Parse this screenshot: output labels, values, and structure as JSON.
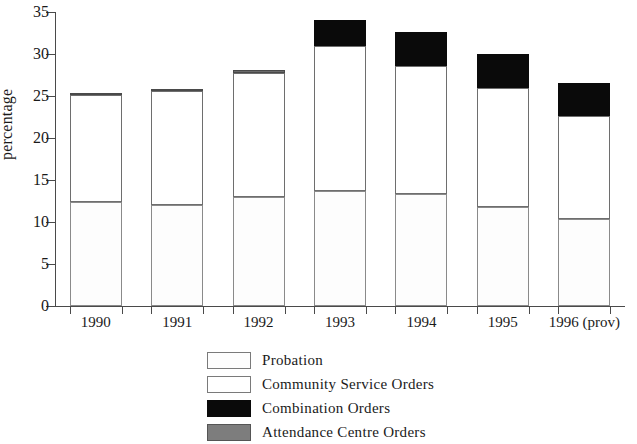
{
  "chart_data": {
    "type": "bar",
    "subtype": "stacked-bar",
    "title": "",
    "xlabel": "",
    "ylabel": "percentage",
    "ylim": [
      0,
      35
    ],
    "yticks": [
      0,
      5,
      10,
      15,
      20,
      25,
      30,
      35
    ],
    "ytick_labels": [
      "0",
      "5",
      "10",
      "15",
      "20",
      "25",
      "30",
      "35"
    ],
    "grid": false,
    "legend_position": "bottom",
    "categories": [
      "1990",
      "1991",
      "1992",
      "1993",
      "1994",
      "1995",
      "1996 (prov)"
    ],
    "series": [
      {
        "name": "Probation",
        "color": "#fdfdfd",
        "values": [
          12.4,
          12.0,
          13.0,
          13.7,
          13.3,
          11.8,
          10.3
        ]
      },
      {
        "name": "Community Service Orders",
        "color": "#ffffff",
        "values": [
          12.7,
          13.6,
          14.7,
          17.3,
          15.3,
          14.2,
          12.3
        ]
      },
      {
        "name": "Combination Orders",
        "color": "#0a0a0a",
        "values": [
          0.0,
          0.0,
          0.0,
          3.0,
          4.0,
          4.0,
          4.0
        ]
      },
      {
        "name": "Attendance Centre Orders",
        "color": "#6b6b6b",
        "values": [
          0.3,
          0.2,
          0.4,
          0.0,
          0.0,
          0.0,
          0.0
        ]
      }
    ],
    "totals": [
      25.4,
      25.8,
      28.1,
      34.0,
      32.6,
      30.0,
      26.6
    ]
  },
  "legend": {
    "items": [
      {
        "label": "Probation",
        "key": "probation"
      },
      {
        "label": "Community Service Orders",
        "key": "cso"
      },
      {
        "label": "Combination Orders",
        "key": "combination"
      },
      {
        "label": "Attendance Centre Orders",
        "key": "attendance"
      }
    ]
  }
}
